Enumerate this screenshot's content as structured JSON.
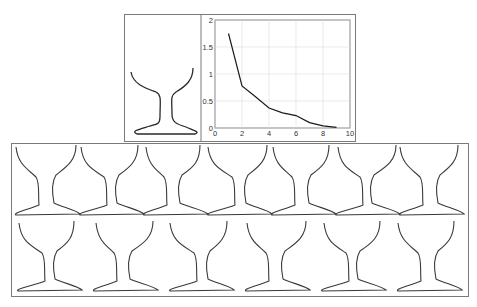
{
  "figure": {
    "top_panel": {
      "reference_shape_label": "reference glass profile",
      "plot": {
        "x_ticks": [
          "0",
          "2",
          "4",
          "6",
          "8",
          "10"
        ],
        "y_ticks": [
          "0",
          "0.5",
          "1",
          "1.5",
          "2"
        ]
      }
    },
    "bottom_panel": {
      "rows": 2,
      "shapes_per_row": [
        7,
        6
      ],
      "shape_label": "generated glass profile"
    }
  },
  "chart_data": {
    "type": "line",
    "title": "",
    "xlabel": "",
    "ylabel": "",
    "x": [
      1,
      2,
      3,
      4,
      5,
      6,
      7,
      8,
      9
    ],
    "values": [
      1.75,
      0.78,
      0.58,
      0.37,
      0.28,
      0.23,
      0.1,
      0.04,
      0.01
    ],
    "xlim": [
      0,
      10
    ],
    "ylim": [
      0,
      2
    ],
    "x_ticks": [
      0,
      2,
      4,
      6,
      8,
      10
    ],
    "y_ticks": [
      0,
      0.5,
      1,
      1.5,
      2
    ],
    "grid": true,
    "legend": null
  },
  "colors": {
    "line": "#1a1a1a",
    "grid": "#d9d9d9",
    "border": "#7a7a7a",
    "shape": "#3a3a3a"
  }
}
